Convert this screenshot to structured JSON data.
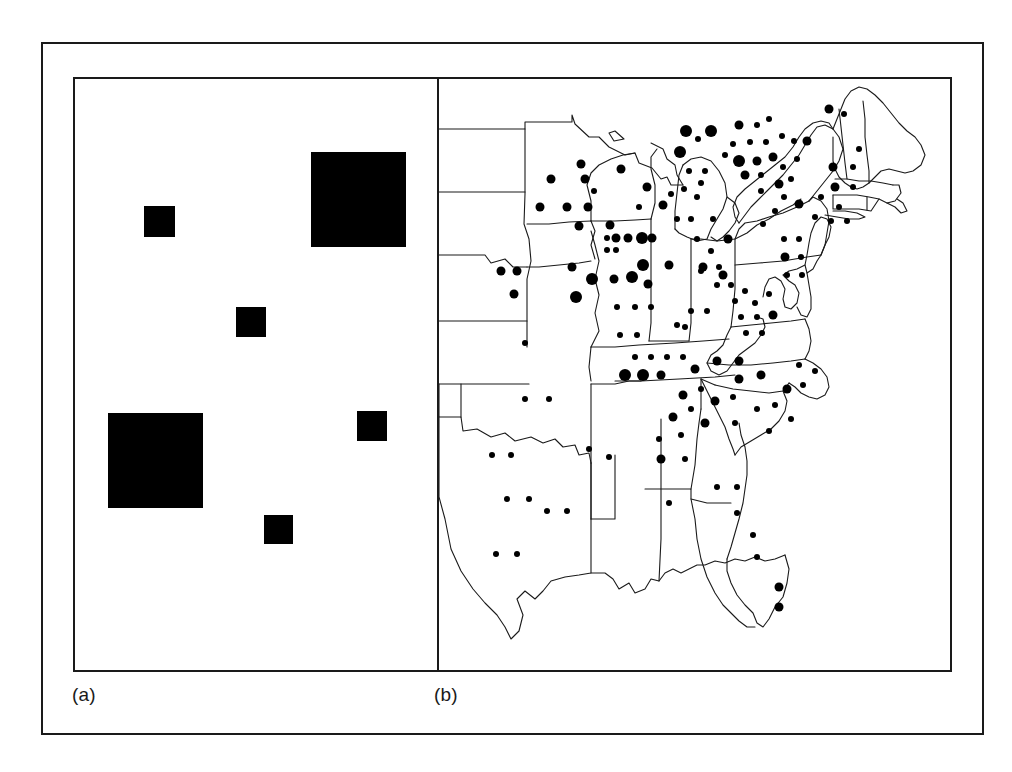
{
  "figure": {
    "type": "two-panel-figure",
    "background_color": "#ffffff",
    "frame_color": "#1a1a1a",
    "symbol_color": "#000000",
    "panels": [
      {
        "key": "a",
        "caption": "(a)",
        "kind": "schematic-proportional-squares"
      },
      {
        "key": "b",
        "caption": "(b)",
        "kind": "proportional-symbol-map"
      }
    ]
  },
  "captions": {
    "panel_a": "(a)",
    "panel_b": "(b)"
  },
  "chart_data": [
    {
      "type": "scatter",
      "panel": "a",
      "title": "",
      "xlabel": "",
      "ylabel": "",
      "grid": false,
      "legend": "none",
      "marker": "filled-square",
      "xlim": [
        0,
        362
      ],
      "ylim": [
        0,
        591
      ],
      "note": "Six filled black squares of three distinct sizes on a blank white panel; size encodes magnitude.",
      "size_classes": [
        {
          "name": "small",
          "side_px": 30,
          "count": 4
        },
        {
          "name": "large",
          "side_px": 95,
          "count": 2
        }
      ],
      "points": [
        {
          "id": "sq1",
          "x": 69,
          "y": 127,
          "size": 31,
          "size_class": "small"
        },
        {
          "id": "sq2",
          "x": 236,
          "y": 73,
          "size": 95,
          "size_class": "large"
        },
        {
          "id": "sq3",
          "x": 161,
          "y": 228,
          "size": 30,
          "size_class": "small"
        },
        {
          "id": "sq4",
          "x": 33,
          "y": 334,
          "size": 95,
          "size_class": "large"
        },
        {
          "id": "sq5",
          "x": 282,
          "y": 332,
          "size": 30,
          "size_class": "small"
        },
        {
          "id": "sq6",
          "x": 189,
          "y": 436,
          "size": 29,
          "size_class": "small"
        }
      ]
    },
    {
      "type": "scatter",
      "panel": "b",
      "title": "",
      "xlabel": "",
      "ylabel": "",
      "grid": false,
      "legend": "none",
      "marker": "filled-circle",
      "basemap": "united-states-east-and-midwest-state-outlines",
      "xlim": [
        0,
        513
      ],
      "ylim": [
        0,
        591
      ],
      "note": "Proportional-symbol map of the eastern and central United States. Filled circles of three radii (small r=3, medium r=4.5, large r=6) mark sites; dense clustering in the Northeast corridor, Great Lakes, Ohio Valley, Carolinas and Georgia, sparse in the Great Plains and Texas.",
      "size_classes": [
        {
          "name": "small",
          "radius_px": 3
        },
        {
          "name": "medium",
          "radius_px": 4.5
        },
        {
          "name": "large",
          "radius_px": 6
        }
      ],
      "points": [
        {
          "x": 112,
          "y": 100,
          "r": 4.5
        },
        {
          "x": 146,
          "y": 100,
          "r": 4.5
        },
        {
          "x": 142,
          "y": 85,
          "r": 4.5
        },
        {
          "x": 101,
          "y": 128,
          "r": 4.5
        },
        {
          "x": 128,
          "y": 128,
          "r": 4.5
        },
        {
          "x": 149,
          "y": 128,
          "r": 4.5
        },
        {
          "x": 62,
          "y": 192,
          "r": 4.5
        },
        {
          "x": 78,
          "y": 192,
          "r": 4.5
        },
        {
          "x": 75,
          "y": 215,
          "r": 4.5
        },
        {
          "x": 86,
          "y": 264,
          "r": 3
        },
        {
          "x": 86,
          "y": 320,
          "r": 3
        },
        {
          "x": 110,
          "y": 320,
          "r": 3
        },
        {
          "x": 53,
          "y": 376,
          "r": 3
        },
        {
          "x": 72,
          "y": 376,
          "r": 3
        },
        {
          "x": 68,
          "y": 420,
          "r": 3
        },
        {
          "x": 90,
          "y": 420,
          "r": 3
        },
        {
          "x": 108,
          "y": 432,
          "r": 3
        },
        {
          "x": 128,
          "y": 432,
          "r": 3
        },
        {
          "x": 57,
          "y": 475,
          "r": 3
        },
        {
          "x": 78,
          "y": 475,
          "r": 3
        },
        {
          "x": 140,
          "y": 147,
          "r": 4.5
        },
        {
          "x": 155,
          "y": 112,
          "r": 3
        },
        {
          "x": 171,
          "y": 146,
          "r": 4.5
        },
        {
          "x": 177,
          "y": 159,
          "r": 4.5
        },
        {
          "x": 168,
          "y": 159,
          "r": 3
        },
        {
          "x": 189,
          "y": 159,
          "r": 4.5
        },
        {
          "x": 203,
          "y": 159,
          "r": 6
        },
        {
          "x": 213,
          "y": 159,
          "r": 4.5
        },
        {
          "x": 168,
          "y": 171,
          "r": 3
        },
        {
          "x": 177,
          "y": 171,
          "r": 3
        },
        {
          "x": 133,
          "y": 188,
          "r": 4.5
        },
        {
          "x": 153,
          "y": 200,
          "r": 6
        },
        {
          "x": 175,
          "y": 200,
          "r": 4.5
        },
        {
          "x": 193,
          "y": 198,
          "r": 6
        },
        {
          "x": 204,
          "y": 186,
          "r": 6
        },
        {
          "x": 209,
          "y": 205,
          "r": 4.5
        },
        {
          "x": 137,
          "y": 218,
          "r": 6
        },
        {
          "x": 178,
          "y": 228,
          "r": 3
        },
        {
          "x": 196,
          "y": 228,
          "r": 3
        },
        {
          "x": 212,
          "y": 228,
          "r": 3
        },
        {
          "x": 181,
          "y": 256,
          "r": 3
        },
        {
          "x": 198,
          "y": 256,
          "r": 3
        },
        {
          "x": 230,
          "y": 186,
          "r": 4.5
        },
        {
          "x": 262,
          "y": 192,
          "r": 3
        },
        {
          "x": 246,
          "y": 248,
          "r": 3
        },
        {
          "x": 182,
          "y": 90,
          "r": 4.5
        },
        {
          "x": 208,
          "y": 108,
          "r": 4.5
        },
        {
          "x": 224,
          "y": 126,
          "r": 4.5
        },
        {
          "x": 232,
          "y": 115,
          "r": 3
        },
        {
          "x": 200,
          "y": 128,
          "r": 3
        },
        {
          "x": 241,
          "y": 73,
          "r": 6
        },
        {
          "x": 250,
          "y": 92,
          "r": 3
        },
        {
          "x": 266,
          "y": 92,
          "r": 3
        },
        {
          "x": 262,
          "y": 104,
          "r": 3
        },
        {
          "x": 245,
          "y": 110,
          "r": 3
        },
        {
          "x": 238,
          "y": 140,
          "r": 3
        },
        {
          "x": 258,
          "y": 118,
          "r": 3
        },
        {
          "x": 272,
          "y": 52,
          "r": 6
        },
        {
          "x": 294,
          "y": 65,
          "r": 3
        },
        {
          "x": 286,
          "y": 76,
          "r": 3
        },
        {
          "x": 247,
          "y": 52,
          "r": 6
        },
        {
          "x": 259,
          "y": 60,
          "r": 3
        },
        {
          "x": 252,
          "y": 140,
          "r": 3
        },
        {
          "x": 274,
          "y": 140,
          "r": 3
        },
        {
          "x": 258,
          "y": 160,
          "r": 3
        },
        {
          "x": 272,
          "y": 172,
          "r": 3
        },
        {
          "x": 289,
          "y": 160,
          "r": 4.5
        },
        {
          "x": 264,
          "y": 188,
          "r": 4.5
        },
        {
          "x": 280,
          "y": 188,
          "r": 3
        },
        {
          "x": 284,
          "y": 196,
          "r": 4.5
        },
        {
          "x": 278,
          "y": 206,
          "r": 3
        },
        {
          "x": 292,
          "y": 206,
          "r": 3
        },
        {
          "x": 300,
          "y": 46,
          "r": 4.5
        },
        {
          "x": 318,
          "y": 46,
          "r": 3
        },
        {
          "x": 330,
          "y": 40,
          "r": 3
        },
        {
          "x": 311,
          "y": 63,
          "r": 3
        },
        {
          "x": 327,
          "y": 63,
          "r": 3
        },
        {
          "x": 343,
          "y": 57,
          "r": 3
        },
        {
          "x": 300,
          "y": 82,
          "r": 6
        },
        {
          "x": 318,
          "y": 82,
          "r": 4.5
        },
        {
          "x": 334,
          "y": 78,
          "r": 4.5
        },
        {
          "x": 344,
          "y": 88,
          "r": 3
        },
        {
          "x": 306,
          "y": 96,
          "r": 4.5
        },
        {
          "x": 322,
          "y": 96,
          "r": 3
        },
        {
          "x": 358,
          "y": 80,
          "r": 3
        },
        {
          "x": 368,
          "y": 62,
          "r": 4.5
        },
        {
          "x": 355,
          "y": 62,
          "r": 3
        },
        {
          "x": 394,
          "y": 88,
          "r": 4.5
        },
        {
          "x": 414,
          "y": 88,
          "r": 3
        },
        {
          "x": 396,
          "y": 108,
          "r": 4.5
        },
        {
          "x": 414,
          "y": 108,
          "r": 3
        },
        {
          "x": 390,
          "y": 30,
          "r": 4.5
        },
        {
          "x": 405,
          "y": 35,
          "r": 3
        },
        {
          "x": 420,
          "y": 70,
          "r": 3
        },
        {
          "x": 382,
          "y": 118,
          "r": 3
        },
        {
          "x": 400,
          "y": 128,
          "r": 3
        },
        {
          "x": 376,
          "y": 138,
          "r": 3
        },
        {
          "x": 392,
          "y": 142,
          "r": 3
        },
        {
          "x": 408,
          "y": 142,
          "r": 3
        },
        {
          "x": 360,
          "y": 125,
          "r": 4.5
        },
        {
          "x": 345,
          "y": 118,
          "r": 3
        },
        {
          "x": 340,
          "y": 105,
          "r": 4.5
        },
        {
          "x": 352,
          "y": 100,
          "r": 3
        },
        {
          "x": 322,
          "y": 112,
          "r": 3
        },
        {
          "x": 336,
          "y": 132,
          "r": 3
        },
        {
          "x": 324,
          "y": 145,
          "r": 3
        },
        {
          "x": 345,
          "y": 160,
          "r": 3
        },
        {
          "x": 360,
          "y": 160,
          "r": 3
        },
        {
          "x": 346,
          "y": 178,
          "r": 4.5
        },
        {
          "x": 362,
          "y": 178,
          "r": 3
        },
        {
          "x": 348,
          "y": 196,
          "r": 3
        },
        {
          "x": 363,
          "y": 196,
          "r": 3
        },
        {
          "x": 296,
          "y": 222,
          "r": 3
        },
        {
          "x": 306,
          "y": 212,
          "r": 3
        },
        {
          "x": 316,
          "y": 224,
          "r": 3
        },
        {
          "x": 330,
          "y": 215,
          "r": 3
        },
        {
          "x": 302,
          "y": 238,
          "r": 3
        },
        {
          "x": 318,
          "y": 238,
          "r": 3
        },
        {
          "x": 334,
          "y": 236,
          "r": 4.5
        },
        {
          "x": 307,
          "y": 254,
          "r": 3
        },
        {
          "x": 323,
          "y": 254,
          "r": 3
        },
        {
          "x": 252,
          "y": 232,
          "r": 3
        },
        {
          "x": 268,
          "y": 232,
          "r": 3
        },
        {
          "x": 238,
          "y": 246,
          "r": 3
        },
        {
          "x": 196,
          "y": 278,
          "r": 3
        },
        {
          "x": 212,
          "y": 278,
          "r": 3
        },
        {
          "x": 228,
          "y": 278,
          "r": 3
        },
        {
          "x": 244,
          "y": 278,
          "r": 3
        },
        {
          "x": 186,
          "y": 296,
          "r": 6
        },
        {
          "x": 204,
          "y": 296,
          "r": 6
        },
        {
          "x": 222,
          "y": 296,
          "r": 4.5
        },
        {
          "x": 256,
          "y": 290,
          "r": 4.5
        },
        {
          "x": 278,
          "y": 282,
          "r": 4.5
        },
        {
          "x": 300,
          "y": 282,
          "r": 4.5
        },
        {
          "x": 300,
          "y": 300,
          "r": 4.5
        },
        {
          "x": 322,
          "y": 296,
          "r": 4.5
        },
        {
          "x": 244,
          "y": 316,
          "r": 4.5
        },
        {
          "x": 262,
          "y": 310,
          "r": 3
        },
        {
          "x": 276,
          "y": 322,
          "r": 4.5
        },
        {
          "x": 294,
          "y": 318,
          "r": 3
        },
        {
          "x": 234,
          "y": 338,
          "r": 4.5
        },
        {
          "x": 252,
          "y": 330,
          "r": 3
        },
        {
          "x": 266,
          "y": 344,
          "r": 4.5
        },
        {
          "x": 318,
          "y": 330,
          "r": 3
        },
        {
          "x": 336,
          "y": 326,
          "r": 3
        },
        {
          "x": 352,
          "y": 340,
          "r": 3
        },
        {
          "x": 330,
          "y": 352,
          "r": 3
        },
        {
          "x": 296,
          "y": 344,
          "r": 3
        },
        {
          "x": 348,
          "y": 310,
          "r": 4.5
        },
        {
          "x": 364,
          "y": 306,
          "r": 3
        },
        {
          "x": 360,
          "y": 286,
          "r": 3
        },
        {
          "x": 376,
          "y": 292,
          "r": 3
        },
        {
          "x": 220,
          "y": 360,
          "r": 3
        },
        {
          "x": 242,
          "y": 356,
          "r": 3
        },
        {
          "x": 222,
          "y": 380,
          "r": 4.5
        },
        {
          "x": 246,
          "y": 380,
          "r": 3
        },
        {
          "x": 230,
          "y": 424,
          "r": 3
        },
        {
          "x": 278,
          "y": 408,
          "r": 3
        },
        {
          "x": 298,
          "y": 408,
          "r": 3
        },
        {
          "x": 298,
          "y": 434,
          "r": 3
        },
        {
          "x": 314,
          "y": 456,
          "r": 3
        },
        {
          "x": 318,
          "y": 478,
          "r": 3
        },
        {
          "x": 340,
          "y": 508,
          "r": 4.5
        },
        {
          "x": 340,
          "y": 528,
          "r": 4.5
        },
        {
          "x": 170,
          "y": 378,
          "r": 3
        },
        {
          "x": 150,
          "y": 370,
          "r": 3
        }
      ]
    }
  ]
}
